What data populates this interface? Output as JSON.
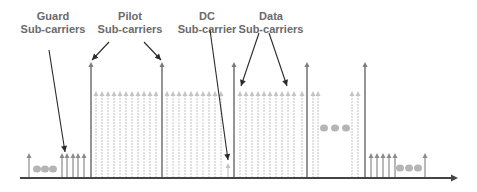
{
  "labels": {
    "guard": {
      "line1": "Guard",
      "line2": "Sub-carriers"
    },
    "pilot": {
      "line1": "Pilot",
      "line2": "Sub-carriers"
    },
    "dc": {
      "line1": "DC",
      "line2": "Sub-carrier"
    },
    "data": {
      "line1": "Data",
      "line2": "Sub-carriers"
    }
  },
  "colors": {
    "pilot": "#7a7a7a",
    "data": "#c4c4c4",
    "guard": "#8a8a8a",
    "axis": "#444444",
    "pointer": "#2a2a2a",
    "dots": "#b5b5b5"
  },
  "baseline_y": 178,
  "pilot_arrows_x": [
    91,
    162,
    234,
    307,
    365
  ],
  "pilot_top_y": 62,
  "data_top_y": 91,
  "data_arrows_x": [
    96,
    102,
    108,
    114,
    120,
    126,
    132,
    138,
    144,
    150,
    156,
    167,
    173,
    179,
    185,
    191,
    197,
    203,
    209,
    215,
    221,
    240,
    246,
    252,
    258,
    264,
    270,
    276,
    282,
    288,
    294,
    302,
    313,
    318,
    352,
    358
  ],
  "guard_arrows_left_x": [
    29,
    62,
    67,
    73,
    78,
    84
  ],
  "guard_arrows_right_x": [
    371,
    377,
    383,
    389,
    395,
    425
  ],
  "guard_top_y": 153,
  "dc_arrow": {
    "x": 228,
    "top_y": 163
  },
  "ellipsis_groups": [
    {
      "x": [
        37,
        45,
        53
      ],
      "y": 169
    },
    {
      "x": [
        324,
        335,
        346
      ],
      "y": 128
    },
    {
      "x": [
        400,
        409,
        418
      ],
      "y": 168
    }
  ]
}
